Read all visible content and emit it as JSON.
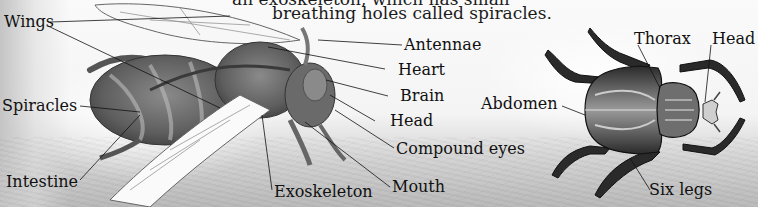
{
  "caption": {
    "line1": "an exoskeleton, which has small",
    "line2": "breathing holes called spiracles."
  },
  "wasp": {
    "labels": {
      "wings": "Wings",
      "spiracles": "Spiracles",
      "intestine": "Intestine",
      "antennae": "Antennae",
      "heart": "Heart",
      "brain": "Brain",
      "head": "Head",
      "compound_eyes": "Compound eyes",
      "mouth": "Mouth",
      "exoskeleton": "Exoskeleton"
    }
  },
  "beetle": {
    "labels": {
      "thorax": "Thorax",
      "head": "Head",
      "abdomen": "Abdomen",
      "six_legs": "Six legs"
    }
  }
}
